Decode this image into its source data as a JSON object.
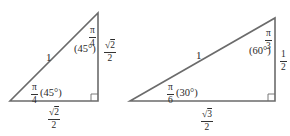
{
  "diagram": {
    "stroke_color": "#6b6b6b",
    "left_triangle": {
      "hypotenuse_label": "1",
      "top_angle": {
        "num": "π",
        "den": "4",
        "degrees": "(45°)"
      },
      "bottom_angle": {
        "num": "π",
        "den": "4",
        "degrees": "(45°)"
      },
      "vertical_side": {
        "num_root": "2",
        "den": "2"
      },
      "horizontal_side": {
        "num_root": "2",
        "den": "2"
      },
      "right_angle_marker": true
    },
    "right_triangle": {
      "hypotenuse_label": "1",
      "top_angle": {
        "num": "π",
        "den": "3",
        "degrees": "(60°)"
      },
      "bottom_angle": {
        "num": "π",
        "den": "6",
        "degrees": "(30°)"
      },
      "vertical_side": {
        "num": "1",
        "den": "2"
      },
      "horizontal_side": {
        "num_root": "3",
        "den": "2"
      },
      "right_angle_marker": true
    }
  }
}
